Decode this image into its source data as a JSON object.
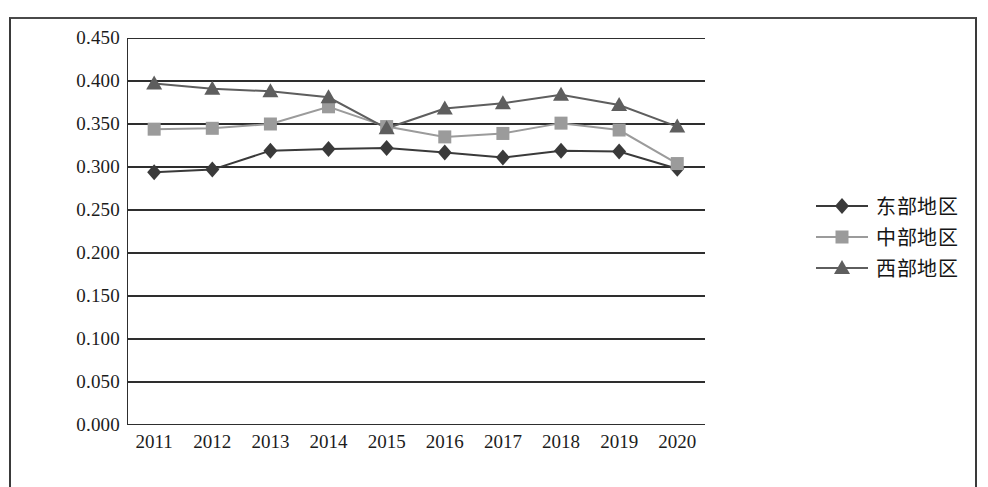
{
  "chart_data": {
    "type": "line",
    "title": "",
    "xlabel": "",
    "ylabel": "",
    "categories": [
      "2011",
      "2012",
      "2013",
      "2014",
      "2015",
      "2016",
      "2017",
      "2018",
      "2019",
      "2020"
    ],
    "ylim": [
      0.0,
      0.45
    ],
    "ytick_labels": [
      "0.450",
      "0.400",
      "0.350",
      "0.300",
      "0.250",
      "0.200",
      "0.150",
      "0.100",
      "0.050",
      "0.000"
    ],
    "ytick_values": [
      0.45,
      0.4,
      0.35,
      0.3,
      0.25,
      0.2,
      0.15,
      0.1,
      0.05,
      0.0
    ],
    "grid": "horizontal",
    "legend_position": "right",
    "series": [
      {
        "name": "东部地区",
        "marker": "diamond",
        "color": "#3a3a3a",
        "values": [
          0.294,
          0.297,
          0.319,
          0.321,
          0.322,
          0.317,
          0.311,
          0.319,
          0.318,
          0.298
        ]
      },
      {
        "name": "中部地区",
        "marker": "square",
        "color": "#9b9b9b",
        "values": [
          0.344,
          0.345,
          0.35,
          0.37,
          0.347,
          0.335,
          0.339,
          0.351,
          0.343,
          0.304
        ]
      },
      {
        "name": "西部地区",
        "marker": "triangle",
        "color": "#5e5e5e",
        "values": [
          0.397,
          0.391,
          0.388,
          0.381,
          0.345,
          0.368,
          0.374,
          0.384,
          0.372,
          0.347
        ]
      }
    ]
  },
  "legend": {
    "items": [
      {
        "label": "东部地区"
      },
      {
        "label": "中部地区"
      },
      {
        "label": "西部地区"
      }
    ]
  }
}
